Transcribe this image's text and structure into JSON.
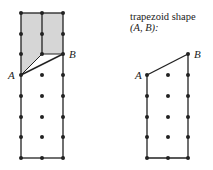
{
  "caption": {
    "line1": "trapezoid shape",
    "line2": "(A, B):"
  },
  "colors": {
    "line": "#222222",
    "fill": "#d6d6d6",
    "dot": "#222222"
  },
  "left_panel": {
    "grid_x": [
      21,
      42,
      63
    ],
    "grid_y": [
      13,
      34,
      54,
      75,
      96,
      117,
      137,
      158
    ],
    "point_A": {
      "label": "A",
      "x": 21,
      "y": 75
    },
    "point_B": {
      "label": "B",
      "x": 63,
      "y": 54
    },
    "shaded_region": "polygon bounded by top of rectangle, the segment A-B and the vertical grid line at x=42"
  },
  "right_panel": {
    "grid_x": [
      147,
      168,
      188
    ],
    "grid_y": [
      54,
      75,
      96,
      117,
      137,
      158
    ],
    "point_A": {
      "label": "A",
      "x": 147,
      "y": 75
    },
    "point_B": {
      "label": "B",
      "x": 188,
      "y": 54
    }
  }
}
